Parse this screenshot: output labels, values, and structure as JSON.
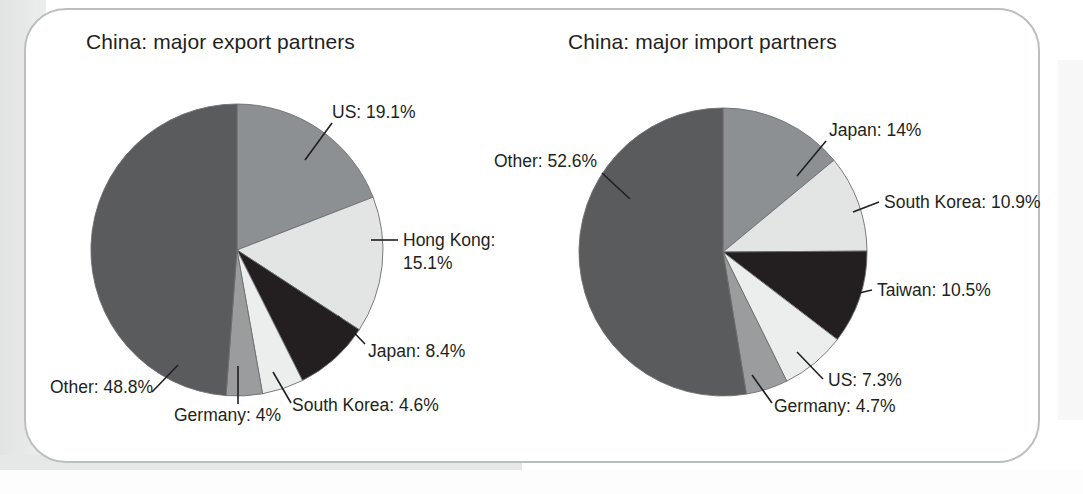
{
  "page": {
    "background_color": "#ffffff",
    "card_border_color": "#bcbfc0"
  },
  "charts": [
    {
      "id": "export",
      "title": "China: major export partners",
      "center": [
        237,
        250
      ],
      "radius": 146
    },
    {
      "id": "import",
      "title": "China: major import partners",
      "center": [
        723,
        252
      ],
      "radius": 144
    }
  ],
  "chart_data": [
    {
      "type": "pie",
      "title": "China: major export partners",
      "xlabel": "",
      "ylabel": "",
      "legend_position": "none",
      "grid": false,
      "categories": [
        "US",
        "Hong Kong",
        "Japan",
        "South Korea",
        "Germany",
        "Other"
      ],
      "values": [
        19.1,
        15.1,
        8.4,
        4.6,
        4.0,
        48.8
      ],
      "labels": [
        "US: 19.1%",
        "Hong Kong: 15.1%",
        "Japan: 8.4%",
        "South Korea: 4.6%",
        "Germany: 4%",
        "Other: 48.8%"
      ],
      "colors": [
        "#8d9093",
        "#e3e5e4",
        "#231f20",
        "#eceeed",
        "#9a9c9e",
        "#595b5d"
      ],
      "start_angle_deg": 0,
      "direction": "clockwise"
    },
    {
      "type": "pie",
      "title": "China: major import partners",
      "xlabel": "",
      "ylabel": "",
      "legend_position": "none",
      "grid": false,
      "categories": [
        "Japan",
        "South Korea",
        "Taiwan",
        "US",
        "Germany",
        "Other"
      ],
      "values": [
        14.0,
        10.9,
        10.5,
        7.3,
        4.7,
        52.6
      ],
      "labels": [
        "Japan: 14%",
        "South Korea: 10.9%",
        "Taiwan: 10.5%",
        "US: 7.3%",
        "Germany: 4.7%",
        "Other: 52.6%"
      ],
      "colors": [
        "#8d9093",
        "#e3e5e4",
        "#231f20",
        "#eceeed",
        "#9a9c9e",
        "#595b5d"
      ],
      "start_angle_deg": 0,
      "direction": "clockwise"
    }
  ],
  "labels_export": {
    "us": "US: 19.1%",
    "hong_kong_line1": "Hong Kong:",
    "hong_kong_line2": "15.1%",
    "japan": "Japan: 8.4%",
    "south_korea": "South Korea: 4.6%",
    "germany": "Germany: 4%",
    "other": "Other: 48.8%"
  },
  "labels_import": {
    "japan": "Japan: 14%",
    "south_korea": "South Korea: 10.9%",
    "taiwan": "Taiwan: 10.5%",
    "us": "US: 7.3%",
    "germany": "Germany: 4.7%",
    "other": "Other: 52.6%"
  }
}
